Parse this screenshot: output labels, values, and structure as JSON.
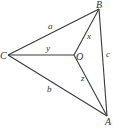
{
  "diagram": {
    "points": {
      "A": {
        "label": "A",
        "x": 107,
        "y": 116
      },
      "B": {
        "label": "B",
        "x": 99,
        "y": 9
      },
      "C": {
        "label": "C",
        "x": 8,
        "y": 55
      },
      "O": {
        "label": "O",
        "x": 74,
        "y": 55
      }
    },
    "segments": {
      "a": {
        "label": "a",
        "from": "C",
        "to": "B"
      },
      "b": {
        "label": "b",
        "from": "C",
        "to": "A"
      },
      "c": {
        "label": "c",
        "from": "B",
        "to": "A"
      },
      "x": {
        "label": "x",
        "from": "O",
        "to": "B"
      },
      "y": {
        "label": "y",
        "from": "C",
        "to": "O"
      },
      "z": {
        "label": "z",
        "from": "O",
        "to": "A"
      }
    },
    "colors": {
      "line": "#3a3a3a",
      "text": "#333333",
      "background": "#ffffff"
    }
  }
}
